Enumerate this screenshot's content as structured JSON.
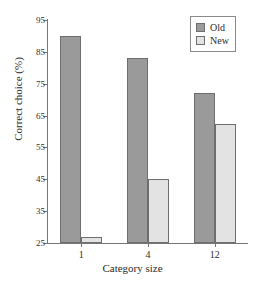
{
  "chart_data": {
    "type": "bar",
    "title": "",
    "xlabel": "Category size",
    "ylabel": "Correct choice (%)",
    "categories": [
      "1",
      "4",
      "12"
    ],
    "series": [
      {
        "name": "Old",
        "color": "#9a9a9a",
        "values": [
          90,
          83,
          72
        ]
      },
      {
        "name": "New",
        "color": "#e3e3e3",
        "values": [
          27,
          45,
          62.5
        ]
      }
    ],
    "ylim": [
      25,
      95
    ],
    "yticks": [
      25,
      35,
      45,
      55,
      65,
      75,
      85,
      95
    ],
    "ytick_labels": [
      "25",
      "35",
      "45",
      "55",
      "65",
      "75",
      "85",
      "95"
    ],
    "xtick_labels": [
      "1",
      "4",
      "12"
    ],
    "grid": false,
    "legend_position": "top-right",
    "legend_entries": [
      "Old",
      "New"
    ]
  },
  "axis": {
    "y_title": "Correct choice (%)",
    "x_title": "Category size"
  },
  "legend": {
    "items": [
      {
        "label": "Old"
      },
      {
        "label": "New"
      }
    ]
  }
}
